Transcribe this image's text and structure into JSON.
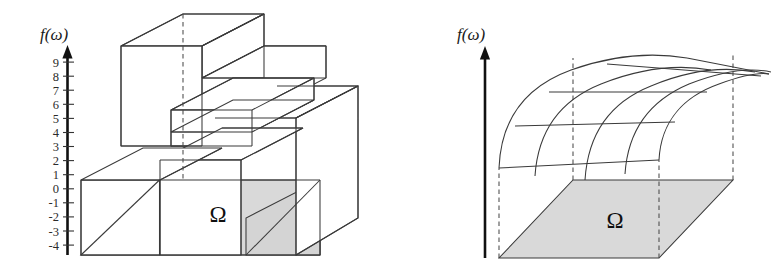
{
  "figure": {
    "title": "",
    "background_color": "#ffffff",
    "panels": [
      {
        "id": "left",
        "name": "piecewise-constant-simple-function",
        "axis": {
          "label": "f(ω)",
          "label_name": "f-omega",
          "arrow_direction": "up",
          "has_ticks": true,
          "tick_labels": [
            "9",
            "8",
            "7",
            "6",
            "5",
            "4",
            "3",
            "2",
            "1",
            "0",
            "-1",
            "-2",
            "-3",
            "-4"
          ],
          "tick_values": [
            9,
            8,
            7,
            6,
            5,
            4,
            3,
            2,
            1,
            0,
            -1,
            -2,
            -3,
            -4
          ],
          "axis_min": -4,
          "axis_max": 9
        },
        "domain_label": "Ω",
        "base_fill": "#d9d9d9",
        "line_color": "#3a3a3a",
        "surface_type": "staircase"
      },
      {
        "id": "right",
        "name": "smooth-function-surface",
        "axis": {
          "label": "f(ω)",
          "label_name": "f-omega",
          "arrow_direction": "up",
          "has_ticks": false,
          "tick_labels": [],
          "tick_values": []
        },
        "domain_label": "Ω",
        "base_fill": "#d9d9d9",
        "line_color": "#3a3a3a",
        "surface_type": "smooth-curved-mesh"
      }
    ],
    "colors": {
      "ink": "#3a3a3a",
      "axis_ink": "#111111",
      "base_gray": "#d9d9d9",
      "white": "#ffffff"
    }
  }
}
